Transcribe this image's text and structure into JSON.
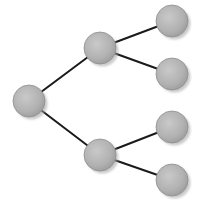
{
  "diagram": {
    "type": "tree",
    "colors": {
      "background": "#ffffff",
      "node_fill": "#b3b3b3",
      "node_fill_light": "#c8c8c8",
      "node_fill_dark": "#9c9c9c",
      "node_stroke": "#8f8f8f",
      "shadow": "#a0a0a0",
      "edge": "#1a1a1a"
    },
    "node_radius": 16,
    "nodes": [
      {
        "id": "root",
        "x": 29,
        "y": 101,
        "label": ""
      },
      {
        "id": "upper-mid",
        "x": 100,
        "y": 48,
        "label": ""
      },
      {
        "id": "lower-mid",
        "x": 100,
        "y": 155,
        "label": ""
      },
      {
        "id": "leaf-1",
        "x": 172,
        "y": 21,
        "label": ""
      },
      {
        "id": "leaf-2",
        "x": 172,
        "y": 74,
        "label": ""
      },
      {
        "id": "leaf-3",
        "x": 172,
        "y": 127,
        "label": ""
      },
      {
        "id": "leaf-4",
        "x": 172,
        "y": 180,
        "label": ""
      }
    ],
    "edges": [
      {
        "from": "root",
        "to": "upper-mid"
      },
      {
        "from": "root",
        "to": "lower-mid"
      },
      {
        "from": "upper-mid",
        "to": "leaf-1"
      },
      {
        "from": "upper-mid",
        "to": "leaf-2"
      },
      {
        "from": "lower-mid",
        "to": "leaf-3"
      },
      {
        "from": "lower-mid",
        "to": "leaf-4"
      }
    ]
  }
}
